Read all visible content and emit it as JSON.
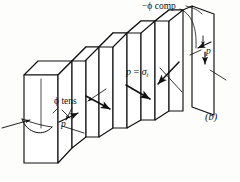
{
  "figure": {
    "panel_label": "(b)",
    "background_color": "#fdfdfc",
    "ink_color": "#111111",
    "labels": {
      "phi_tens": "ϕ tens",
      "phi_comp": "−ϕ comp",
      "p_equals_sigma_t_lead": "p",
      "p_equals_sigma_t_eq": "=",
      "p_equals_sigma_t_sigma": "σ",
      "p_equals_sigma_t_sub": "t",
      "p_left": "p",
      "p_right": "p"
    },
    "icon_names": {
      "block": "prismatic-block",
      "slabs": "fractured-slab-series",
      "tension_arrows": "tension-arrow-cluster",
      "compression_arrows": "compression-arrow-cluster",
      "shear_arrows": "shear-arrow-pair",
      "torsion_arc": "torsion-arc-arrow"
    }
  }
}
